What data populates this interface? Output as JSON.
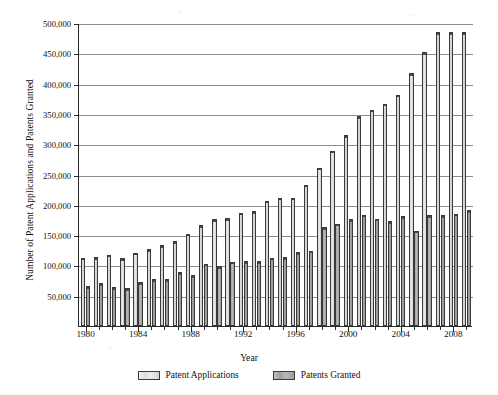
{
  "chart_data": {
    "type": "bar",
    "title": "",
    "xlabel": "Year",
    "ylabel": "Number of Patent Applications and Patents Granted",
    "grid": true,
    "legend_position": "bottom",
    "ylim": [
      0,
      500000
    ],
    "ytick_values": [
      50000,
      100000,
      150000,
      200000,
      250000,
      300000,
      350000,
      400000,
      450000,
      500000
    ],
    "ytick_labels": [
      "50,000",
      "100,000",
      "150,000",
      "200,000",
      "250,000",
      "300,000",
      "350,000",
      "400,000",
      "450,000",
      "500,000"
    ],
    "categories": [
      1980,
      1981,
      1982,
      1983,
      1984,
      1985,
      1986,
      1987,
      1988,
      1989,
      1990,
      1991,
      1992,
      1993,
      1994,
      1995,
      1996,
      1997,
      1998,
      1999,
      2000,
      2001,
      2002,
      2003,
      2004,
      2005,
      2006,
      2007,
      2008,
      2009
    ],
    "xtick_labels": [
      "1980",
      "1984",
      "1988",
      "1992",
      "1996",
      "2000",
      "2004",
      "2008"
    ],
    "xtick_label_years": [
      1980,
      1984,
      1988,
      1992,
      1996,
      2000,
      2004,
      2008
    ],
    "series": [
      {
        "name": "Patent Applications",
        "color": "#e2e2e2",
        "values": [
          113000,
          114000,
          118000,
          112000,
          121000,
          127000,
          133000,
          140000,
          152000,
          166000,
          176000,
          178000,
          187000,
          189000,
          207000,
          212000,
          212000,
          233000,
          261000,
          289000,
          315000,
          346000,
          357000,
          367000,
          382000,
          417000,
          452000,
          485000,
          485000,
          485000
        ]
      },
      {
        "name": "Patents Granted",
        "color": "#a8a8a8",
        "values": [
          66000,
          71000,
          64000,
          62000,
          72000,
          77000,
          77000,
          89000,
          84000,
          103000,
          99000,
          106000,
          107000,
          107000,
          113000,
          114000,
          122000,
          124000,
          163000,
          169000,
          176000,
          184000,
          177000,
          173000,
          181000,
          157000,
          183000,
          183000,
          185000,
          191000
        ]
      }
    ]
  },
  "legend": {
    "items": [
      {
        "label": "Patent Applications"
      },
      {
        "label": "Patents Granted"
      }
    ]
  }
}
